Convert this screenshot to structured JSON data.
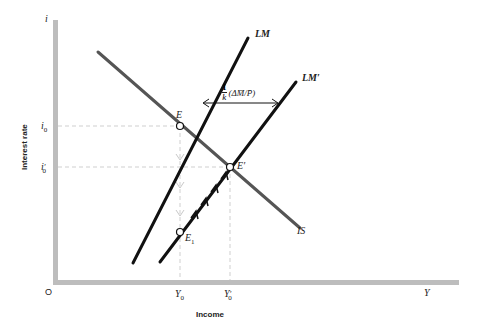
{
  "diagram": {
    "axes": {
      "y_axis_symbol": "i",
      "y_axis_label": "Interest rate",
      "x_axis_symbol": "Y",
      "x_axis_label": "Income",
      "origin_label": "O"
    },
    "ticks": {
      "y": [
        {
          "label": "i0",
          "main": "i",
          "sub": "0",
          "prime": ""
        },
        {
          "label": "i'0",
          "main": "i",
          "sub": "0",
          "prime": "′"
        }
      ],
      "x": [
        {
          "label": "Y0",
          "main": "Y",
          "sub": "0",
          "prime": ""
        },
        {
          "label": "Y'0",
          "main": "Y",
          "sub": "0",
          "prime": "′"
        }
      ]
    },
    "curves": {
      "lm": "LM",
      "lm_prime": "LM′",
      "is": "IS"
    },
    "points": {
      "e": "E",
      "e_prime": "E′",
      "e1_main": "E",
      "e1_sub": "1"
    },
    "shift_annotation": {
      "numerator": "1",
      "denominator": "k",
      "expression": "(ΔM̄/P̄)"
    },
    "colors": {
      "axis": "#b8b8b8",
      "lm": "#111111",
      "is": "#555555",
      "guide": "#c8c8c8"
    }
  }
}
